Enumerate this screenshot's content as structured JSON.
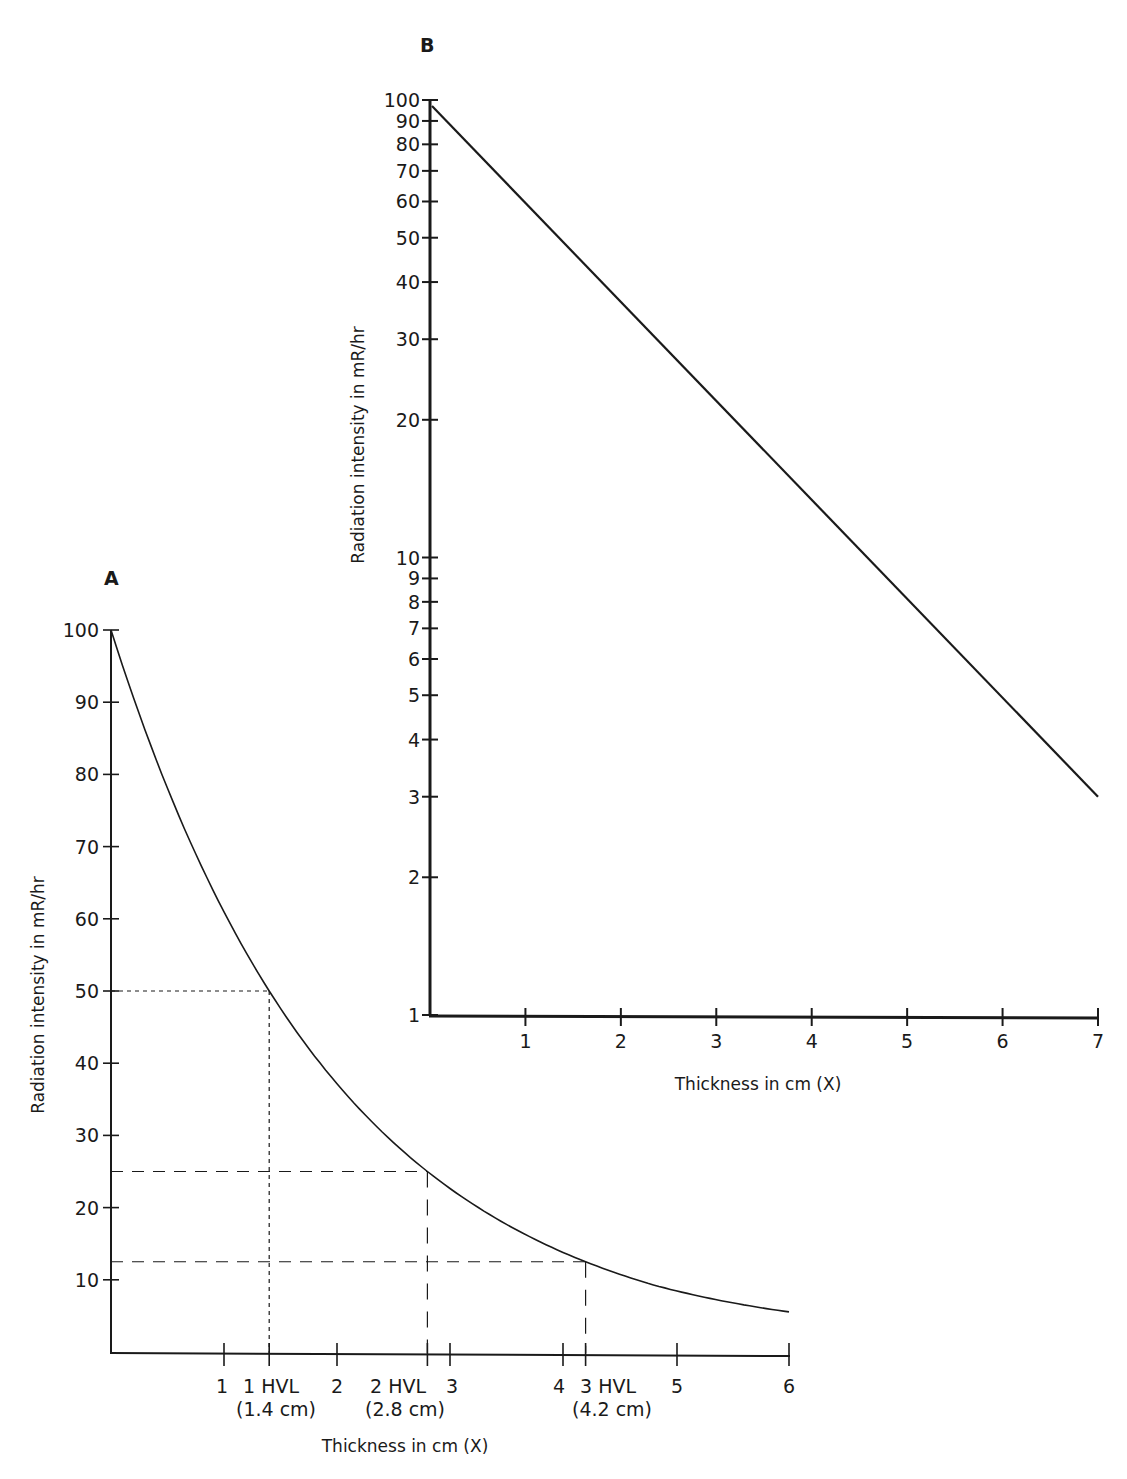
{
  "chart_data": [
    {
      "panel": "A",
      "type": "line",
      "title": "A",
      "xlabel": "Thickness in cm (X)",
      "ylabel": "Radiation intensity in mR/hr",
      "yscale": "linear",
      "xlim": [
        0,
        6
      ],
      "ylim": [
        0,
        100
      ],
      "x_ticks": [
        1,
        2,
        3,
        4,
        5,
        6
      ],
      "y_ticks": [
        10,
        20,
        30,
        40,
        50,
        60,
        70,
        80,
        90,
        100
      ],
      "grid": false,
      "series": [
        {
          "name": "Attenuation curve",
          "x": [
            0,
            0.5,
            1.0,
            1.4,
            2.0,
            2.8,
            3.5,
            4.2,
            5.0,
            6.0
          ],
          "y": [
            100,
            78,
            61,
            50,
            37,
            25,
            17.6,
            12.5,
            8.4,
            5.2
          ]
        }
      ],
      "annotations": [
        {
          "label": "1 HVL",
          "sublabel": "(1.4 cm)",
          "x": 1.4,
          "y": 50
        },
        {
          "label": "2 HVL",
          "sublabel": "(2.8 cm)",
          "x": 2.8,
          "y": 25
        },
        {
          "label": "3 HVL",
          "sublabel": "(4.2 cm)",
          "x": 4.2,
          "y": 12.5
        }
      ]
    },
    {
      "panel": "B",
      "type": "line",
      "title": "B",
      "xlabel": "Thickness in cm (X)",
      "ylabel": "Radiation intensity in mR/hr",
      "yscale": "log",
      "xlim": [
        0,
        7
      ],
      "ylim": [
        1,
        100
      ],
      "x_ticks": [
        1,
        2,
        3,
        4,
        5,
        6,
        7
      ],
      "y_ticks": [
        1,
        2,
        3,
        4,
        5,
        6,
        7,
        8,
        9,
        10,
        20,
        30,
        40,
        50,
        60,
        70,
        80,
        90,
        100
      ],
      "grid": false,
      "series": [
        {
          "name": "Attenuation (log scale)",
          "x": [
            0,
            7
          ],
          "y": [
            97,
            3
          ]
        }
      ]
    }
  ],
  "labels": {
    "panel_a": "A",
    "panel_b": "B",
    "xlabel": "Thickness in cm (X)",
    "ylabel": "Radiation intensity in mR/hr",
    "hvl1": "1 HVL",
    "hvl1_cm": "(1.4 cm)",
    "hvl2": "2 HVL",
    "hvl2_cm": "(2.8 cm)",
    "hvl3": "3 HVL",
    "hvl3_cm": "(4.2 cm)"
  }
}
